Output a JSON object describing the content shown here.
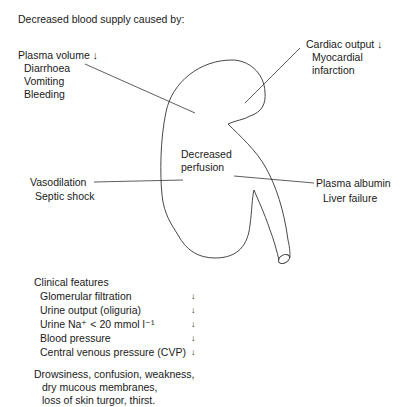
{
  "title": "Decreased blood supply caused by:",
  "causes": {
    "plasma_volume": {
      "label": "Plasma volume",
      "direction": "↓",
      "items": [
        "Diarrhoea",
        "Vomiting",
        "Bleeding"
      ]
    },
    "cardiac_output": {
      "label": "Cardiac output",
      "direction": "↓",
      "items": [
        "Myocardial",
        "infarction"
      ]
    },
    "vasodilation": {
      "label": "Vasodilation",
      "items": [
        "Septic shock"
      ]
    },
    "plasma_albumin": {
      "label": "Plasma albumin",
      "items": [
        "Liver failure"
      ]
    }
  },
  "center": {
    "line1": "Decreased",
    "line2": "perfusion"
  },
  "clinical": {
    "heading": "Clinical features",
    "features": [
      {
        "label": "Glomerular filtration",
        "direction": "↓"
      },
      {
        "label": "Urine output (oliguria)",
        "direction": "↓"
      },
      {
        "label": "Urine Na⁺ < 20 mmol l⁻¹",
        "direction": "↓"
      },
      {
        "label": "Blood pressure",
        "direction": "↓"
      },
      {
        "label": "Central venous pressure (CVP)",
        "direction": "↓"
      }
    ],
    "symptoms": [
      "Drowsiness, confusion, weakness,",
      "dry mucous membranes,",
      "loss of skin turgor, thirst."
    ]
  },
  "colors": {
    "ink": "#1a1a1a",
    "line": "#333333",
    "background": "#ffffff"
  }
}
